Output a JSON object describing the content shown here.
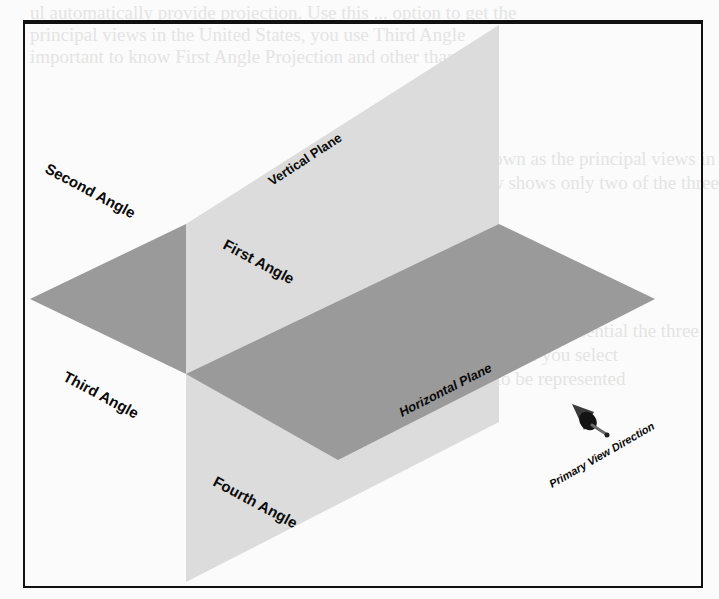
{
  "figure": {
    "colors": {
      "background": "#fbfbfb",
      "vertical_plane": "#dcdcdc",
      "horizontal_plane": "#9a9a9a",
      "frame": "#111111",
      "label": "#0a0a0a"
    },
    "labels": {
      "vertical_plane": "Vertical Plane",
      "horizontal_plane": "Horizontal Plane",
      "first_angle": "First Angle",
      "second_angle": "Second Angle",
      "third_angle": "Third Angle",
      "fourth_angle": "Fourth Angle",
      "primary_view_direction": "Primary View Direction"
    },
    "icons": {
      "view_direction": "cone-arrow-icon"
    }
  },
  "bleed_through": {
    "line1": "ul automatically provide projection. Use this ... option to get the",
    "line2": "principal views in the United States, you use Third Angle",
    "line3": "important to know First Angle Projection and other than",
    "line4": "These six views are known as the principal views in",
    "line5": "projection, each (2D) view shows only two of the three",
    "line6": "depth) of the object.",
    "line7": "When using projections, it is essential the three",
    "line8": "tion) are aligned with the plane you select",
    "line9": "determine the orientation to be represented"
  }
}
